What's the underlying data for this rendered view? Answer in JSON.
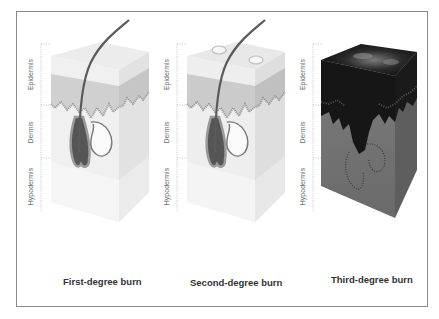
{
  "figure": {
    "panels": [
      {
        "id": "first",
        "caption": "First-degree burn",
        "layers": [
          "Epidermis",
          "Dermis",
          "Hypodermis"
        ],
        "style": "light"
      },
      {
        "id": "second",
        "caption": "Second-degree burn",
        "layers": [
          "Epidermis",
          "Dermis",
          "Hypodermis"
        ],
        "style": "light-blister"
      },
      {
        "id": "third",
        "caption": "Third-degree burn",
        "layers": [
          "Epidermis",
          "Dermis",
          "Hypodermis"
        ],
        "style": "charred"
      }
    ],
    "colors": {
      "frame_border": "#8a8a8a",
      "caption_text": "#333333",
      "label_text": "#6b6b6b",
      "skin_light": "#e6e6e6",
      "epidermis": "#d4d4d4",
      "hair": "#5a5a5a",
      "charred": "#151515",
      "third_dermis": "#6e6e6e"
    }
  }
}
